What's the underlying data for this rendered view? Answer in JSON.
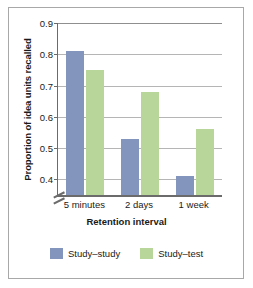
{
  "chart_data": {
    "type": "bar",
    "title": "",
    "xlabel": "Retention interval",
    "ylabel": "Proportion of idea units recalled",
    "categories": [
      "5 minutes",
      "2 days",
      "1 week"
    ],
    "series": [
      {
        "name": "Study–study",
        "color": "#8395bd",
        "values": [
          0.81,
          0.53,
          0.41
        ]
      },
      {
        "name": "Study–test",
        "color": "#b9d69a",
        "values": [
          0.75,
          0.68,
          0.56
        ]
      }
    ],
    "ylim": [
      0.35,
      0.9
    ],
    "yticks": [
      0.4,
      0.5,
      0.6,
      0.7,
      0.8,
      0.9
    ],
    "ytick_labels": [
      "0.4",
      "0.5",
      "0.6",
      "0.7",
      "0.8",
      "0.9"
    ],
    "grid": true,
    "axis_break": true,
    "legend_position": "bottom"
  },
  "legend": {
    "items": [
      {
        "label": "Study–study",
        "color": "#8395bd"
      },
      {
        "label": "Study–test",
        "color": "#b9d69a"
      }
    ]
  }
}
